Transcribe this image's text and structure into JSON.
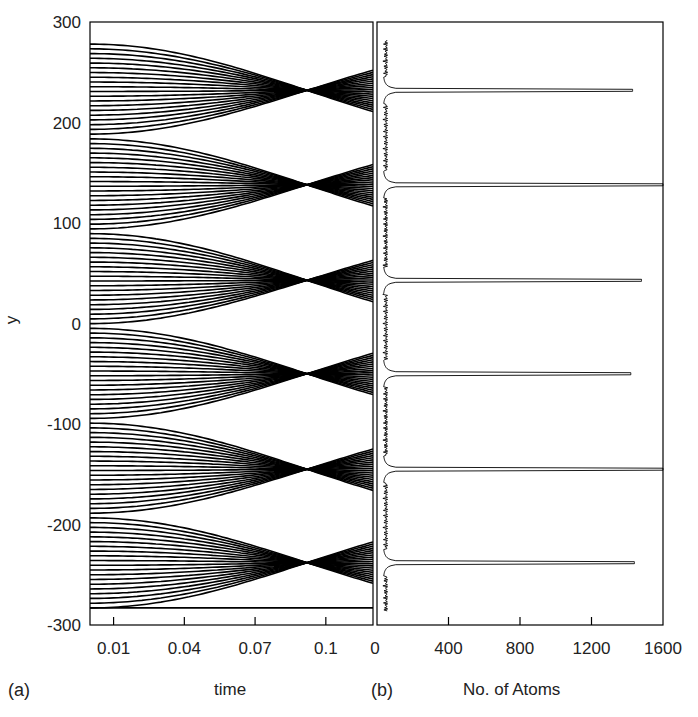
{
  "chart_data": [
    {
      "panel": "(a)",
      "type": "line",
      "title": "",
      "xlabel": "time",
      "ylabel": "y",
      "xlim": [
        0,
        0.12
      ],
      "ylim": [
        -300,
        300
      ],
      "xticks": [
        0.01,
        0.04,
        0.07,
        0.1
      ],
      "xtick_labels": [
        "0.01",
        "0.04",
        "0.07",
        "0.1"
      ],
      "yticks": [
        300,
        200,
        100,
        0,
        -100,
        -200,
        -300
      ],
      "ytick_labels": [
        "300",
        "200",
        "100",
        "0",
        "-100",
        "-200",
        "-300"
      ],
      "grid": false,
      "description": "Atom trajectories in a standing-wave lens array; initial positions uniformly spread from -283 to 278, each period (~94 units) focuses toward its center near t≈0.09 and then crosses over",
      "initial_y_range": [
        -283,
        278
      ],
      "num_trajectories": 120,
      "focus_centers": [
        232,
        138,
        43,
        -50,
        -145,
        -238
      ],
      "period": 94,
      "focus_time": 0.092
    },
    {
      "panel": "(b)",
      "type": "line",
      "title": "",
      "xlabel": "No. of Atoms",
      "ylabel": "",
      "xlim": [
        0,
        1600
      ],
      "ylim": [
        -300,
        300
      ],
      "xticks": [
        0,
        400,
        800,
        1200,
        1600
      ],
      "xtick_labels": [
        "0",
        "400",
        "800",
        "1200",
        "1600"
      ],
      "grid": false,
      "description": "Histogram of atom positions at final time: sharp peaks at focus centers, low background (~40-80 atoms) elsewhere",
      "peaks": [
        {
          "y": 232,
          "count": 1430
        },
        {
          "y": 138,
          "count": 1600
        },
        {
          "y": 43,
          "count": 1480
        },
        {
          "y": -50,
          "count": 1420
        },
        {
          "y": -145,
          "count": 1600
        },
        {
          "y": -238,
          "count": 1440
        }
      ],
      "background_count": 60
    }
  ],
  "labels": {
    "panel_a": "(a)",
    "panel_b": "(b)",
    "xlabel_a": "time",
    "xlabel_b": "No. of Atoms",
    "ylabel": "y"
  }
}
